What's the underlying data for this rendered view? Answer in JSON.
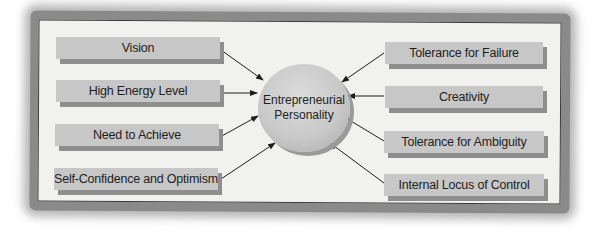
{
  "diagram": {
    "center": {
      "line1": "Entrepreneurial",
      "line2": "Personality"
    },
    "left_traits": [
      {
        "label": "Vision"
      },
      {
        "label": "High Energy Level"
      },
      {
        "label": "Need to Achieve"
      },
      {
        "label": "Self-Confidence and Optimism"
      }
    ],
    "right_traits": [
      {
        "label": "Tolerance for Failure"
      },
      {
        "label": "Creativity"
      },
      {
        "label": "Tolerance for Ambiguity"
      },
      {
        "label": "Internal Locus of Control"
      }
    ],
    "colors": {
      "box_fill": "#c7c7c7",
      "box_shadow": "#8e8e8e",
      "panel": "#f1f1ef",
      "arrow": "#1e1e1e"
    }
  }
}
